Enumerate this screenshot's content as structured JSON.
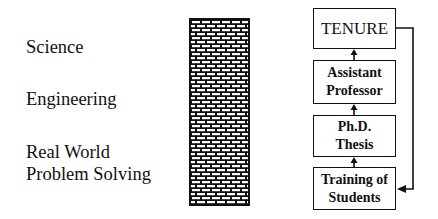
{
  "left_labels": [
    {
      "text": "Science"
    },
    {
      "text": "Engineering"
    },
    {
      "text": "Real World"
    },
    {
      "text": "Problem Solving"
    }
  ],
  "wall": {
    "label": "brick-wall",
    "pattern": "brick"
  },
  "boxes": {
    "tenure": {
      "line1": "TENURE"
    },
    "assistant_professor": {
      "line1": "Assistant",
      "line2": "Professor"
    },
    "phd_thesis": {
      "line1": "Ph.D.",
      "line2": "Thesis"
    },
    "training": {
      "line1": "Training of",
      "line2": "Students"
    }
  },
  "flow": [
    {
      "from": "Training of Students",
      "to": "Ph.D. Thesis"
    },
    {
      "from": "Ph.D. Thesis",
      "to": "Assistant Professor"
    },
    {
      "from": "Assistant Professor",
      "to": "TENURE"
    },
    {
      "from": "TENURE",
      "to": "Training of Students",
      "type": "feedback"
    }
  ],
  "colors": {
    "ink": "#111111",
    "background": "#ffffff"
  }
}
